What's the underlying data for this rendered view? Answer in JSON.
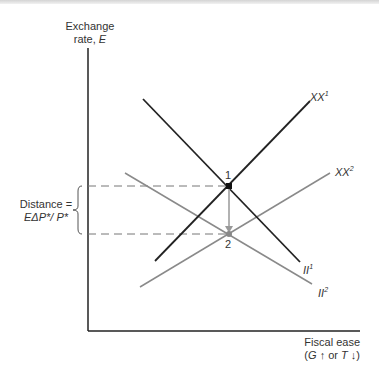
{
  "axes": {
    "y_label_line1": "Exchange",
    "y_label_line2": "rate, ",
    "y_label_var": "E",
    "x_label_line1": "Fiscal ease",
    "x_label_line2_open": "(",
    "x_label_G": "G",
    "x_label_up": " ↑ or ",
    "x_label_T": "T",
    "x_label_down": " ↓)"
  },
  "curves": {
    "xx1": {
      "name": "XX",
      "sup": "1",
      "color": "#222222"
    },
    "xx2": {
      "name": "XX",
      "sup": "2",
      "color": "#8a8a8a"
    },
    "ii1": {
      "name": "II",
      "sup": "1",
      "color": "#222222"
    },
    "ii2": {
      "name": "II",
      "sup": "2",
      "color": "#8a8a8a"
    }
  },
  "points": {
    "p1": "1",
    "p2": "2"
  },
  "distance": {
    "line1": "Distance =",
    "line2": "EΔP*/ P*"
  }
}
